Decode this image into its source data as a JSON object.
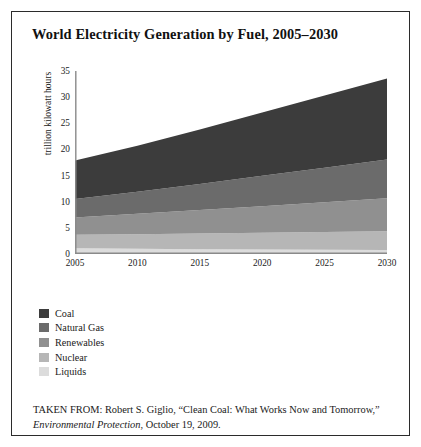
{
  "figure": {
    "title": "World Electricity Generation by Fuel, 2005–2030",
    "border_color": "#2b2b2b",
    "background": "#ffffff"
  },
  "chart_data": {
    "type": "area",
    "title": "World Electricity Generation by Fuel, 2005–2030",
    "xlabel": "",
    "ylabel": "trillion kilowatt hours",
    "x": [
      2005,
      2010,
      2015,
      2020,
      2025,
      2030
    ],
    "categories": [
      "2005",
      "2010",
      "2015",
      "2020",
      "2025",
      "2030"
    ],
    "xlim": [
      2005,
      2030
    ],
    "ylim": [
      0,
      35
    ],
    "yticks": [
      0,
      5,
      10,
      15,
      20,
      25,
      30,
      35
    ],
    "ytick_labels": [
      "0",
      "5",
      "10",
      "15",
      "20",
      "25",
      "30",
      "35"
    ],
    "xticks": [
      2005,
      2010,
      2015,
      2020,
      2025,
      2030
    ],
    "xtick_labels": [
      "2005",
      "2010",
      "2015",
      "2020",
      "2025",
      "2030"
    ],
    "grid": false,
    "stacked": true,
    "stack_order_bottom_to_top": [
      "Liquids",
      "Nuclear",
      "Renewables",
      "Natural Gas",
      "Coal"
    ],
    "legend_position": "below-left",
    "series": [
      {
        "name": "Coal",
        "color": "#3c3c3c",
        "values": [
          7.4,
          8.8,
          10.4,
          12.1,
          13.8,
          15.5
        ]
      },
      {
        "name": "Natural Gas",
        "color": "#6b6b6b",
        "values": [
          3.5,
          4.2,
          5.0,
          5.8,
          6.6,
          7.4
        ]
      },
      {
        "name": "Renewables",
        "color": "#909090",
        "values": [
          3.3,
          3.9,
          4.5,
          5.1,
          5.7,
          6.3
        ]
      },
      {
        "name": "Nuclear",
        "color": "#b6b6b6",
        "values": [
          2.6,
          2.8,
          3.0,
          3.2,
          3.4,
          3.6
        ]
      },
      {
        "name": "Liquids",
        "color": "#dcdcdc",
        "values": [
          1.1,
          1.0,
          0.9,
          0.85,
          0.8,
          0.75
        ]
      }
    ],
    "totals": [
      17.9,
      20.7,
      23.8,
      27.05,
      30.3,
      33.55
    ]
  },
  "legend": {
    "items": [
      {
        "label": "Coal",
        "color": "#3c3c3c"
      },
      {
        "label": "Natural Gas",
        "color": "#6b6b6b"
      },
      {
        "label": "Renewables",
        "color": "#909090"
      },
      {
        "label": "Nuclear",
        "color": "#b6b6b6"
      },
      {
        "label": "Liquids",
        "color": "#dcdcdc"
      }
    ]
  },
  "caption": {
    "prefix": "TAKEN FROM: Robert S. Giglio, “Clean Coal: What Works Now and Tomorrow,” ",
    "source_italic": "Environmental Protection",
    "suffix": ", October 19, 2009."
  }
}
